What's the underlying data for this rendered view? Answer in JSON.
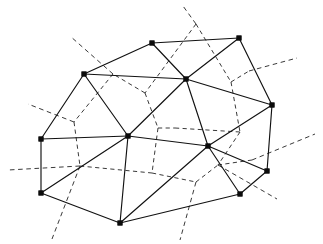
{
  "figure": {
    "width": 323,
    "height": 244,
    "background_color": "#ffffff",
    "delaunay_color": "#111111",
    "voronoi_color": "#3a3a3a",
    "site_marker_color": "#0b0b0b",
    "site_marker_shape": "square",
    "site_marker_size": 4.6,
    "delaunay_line_style": "solid",
    "voronoi_line_style": "dashed"
  },
  "chart_data": {
    "type": "scatter",
    "xlabel": "",
    "ylabel": "",
    "grid": false,
    "legend": null,
    "xlim": [
      0,
      323
    ],
    "ylim": [
      0,
      244
    ],
    "sites": [
      {
        "id": "v0",
        "label": "top-left-upper",
        "x": 152,
        "y": 43
      },
      {
        "id": "v1",
        "label": "top-right",
        "x": 239,
        "y": 38
      },
      {
        "id": "v2",
        "label": "upper-left",
        "x": 84,
        "y": 74
      },
      {
        "id": "v3",
        "label": "upper-center",
        "x": 186,
        "y": 79
      },
      {
        "id": "v4",
        "label": "right-upper",
        "x": 272,
        "y": 105
      },
      {
        "id": "v5",
        "label": "left-middle",
        "x": 41,
        "y": 139
      },
      {
        "id": "v6",
        "label": "center-hub",
        "x": 128,
        "y": 136
      },
      {
        "id": "v7",
        "label": "right-center",
        "x": 208,
        "y": 146
      },
      {
        "id": "v8",
        "label": "right-lower",
        "x": 267,
        "y": 171
      },
      {
        "id": "v9",
        "label": "left-lower",
        "x": 41,
        "y": 193
      },
      {
        "id": "v10",
        "label": "bottom-center",
        "x": 120,
        "y": 223
      },
      {
        "id": "v11",
        "label": "bottom-right",
        "x": 240,
        "y": 194
      }
    ],
    "delaunay_edges": [
      [
        "v0",
        "v1"
      ],
      [
        "v0",
        "v2"
      ],
      [
        "v0",
        "v3"
      ],
      [
        "v1",
        "v3"
      ],
      [
        "v1",
        "v4"
      ],
      [
        "v2",
        "v3"
      ],
      [
        "v2",
        "v5"
      ],
      [
        "v2",
        "v6"
      ],
      [
        "v3",
        "v4"
      ],
      [
        "v3",
        "v6"
      ],
      [
        "v3",
        "v7"
      ],
      [
        "v4",
        "v7"
      ],
      [
        "v4",
        "v8"
      ],
      [
        "v5",
        "v6"
      ],
      [
        "v5",
        "v9"
      ],
      [
        "v6",
        "v7"
      ],
      [
        "v6",
        "v9"
      ],
      [
        "v6",
        "v10"
      ],
      [
        "v7",
        "v8"
      ],
      [
        "v7",
        "v10"
      ],
      [
        "v7",
        "v11"
      ],
      [
        "v8",
        "v11"
      ],
      [
        "v9",
        "v10"
      ],
      [
        "v10",
        "v11"
      ]
    ],
    "voronoi_vertices": [
      {
        "id": "c0",
        "x": 196,
        "y": 24
      },
      {
        "id": "c1",
        "x": 145,
        "y": 93
      },
      {
        "id": "c2",
        "x": 231,
        "y": 82
      },
      {
        "id": "c3",
        "x": 249,
        "y": 71
      },
      {
        "id": "c4",
        "x": 113,
        "y": 74
      },
      {
        "id": "c5",
        "x": 74,
        "y": 122
      },
      {
        "id": "c6",
        "x": 158,
        "y": 128
      },
      {
        "id": "c7",
        "x": 175,
        "y": 128
      },
      {
        "id": "c8",
        "x": 240,
        "y": 132
      },
      {
        "id": "c9",
        "x": 252,
        "y": 160
      },
      {
        "id": "c10",
        "x": 80,
        "y": 166
      },
      {
        "id": "c11",
        "x": 152,
        "y": 173
      },
      {
        "id": "c12",
        "x": 196,
        "y": 182
      },
      {
        "id": "c13",
        "x": 218,
        "y": 165
      }
    ],
    "voronoi_edges": [
      [
        "c0",
        "c1"
      ],
      [
        "c0",
        "c2"
      ],
      [
        "c1",
        "c4"
      ],
      [
        "c1",
        "c6"
      ],
      [
        "c2",
        "c3"
      ],
      [
        "c2",
        "c8"
      ],
      [
        "c4",
        "c5"
      ],
      [
        "c5",
        "c10"
      ],
      [
        "c6",
        "c7"
      ],
      [
        "c6",
        "c11"
      ],
      [
        "c7",
        "c8"
      ],
      [
        "c8",
        "c13"
      ],
      [
        "c9",
        "c13"
      ],
      [
        "c10",
        "c11"
      ],
      [
        "c11",
        "c12"
      ],
      [
        "c12",
        "c13"
      ]
    ],
    "voronoi_rays": [
      {
        "from": "c0",
        "to_x": 183,
        "to_y": 6,
        "label": "ray-top"
      },
      {
        "from": "c4",
        "to_x": 70,
        "to_y": 36,
        "label": "ray-upper-left"
      },
      {
        "from": "c3",
        "to_x": 297,
        "to_y": 58,
        "label": "ray-upper-right"
      },
      {
        "from": "c5",
        "to_x": 28,
        "to_y": 104,
        "label": "ray-left"
      },
      {
        "from": "c9",
        "to_x": 315,
        "to_y": 134,
        "label": "ray-right"
      },
      {
        "from": "c10",
        "to_x": 8,
        "to_y": 170,
        "label": "ray-left-lower"
      },
      {
        "from": "c10",
        "to_x": 52,
        "to_y": 239,
        "label": "ray-lower-left"
      },
      {
        "from": "c12",
        "to_x": 180,
        "to_y": 240,
        "label": "ray-bottom"
      },
      {
        "from": "c13",
        "to_x": 277,
        "to_y": 199,
        "label": "ray-lower-right"
      }
    ]
  }
}
